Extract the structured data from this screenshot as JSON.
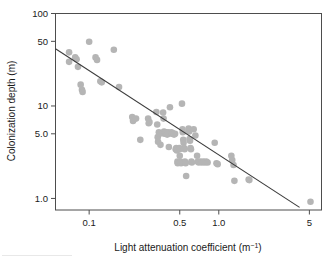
{
  "chart_data": {
    "type": "scatter",
    "title": "",
    "xlabel": "Light attenuation coefficient (m⁻¹)",
    "xlabel_base": "Light attenuation coefficient (m",
    "xlabel_exponent": "−1",
    "xlabel_close": ")",
    "ylabel": "Colonization depth (m)",
    "xscale": "log",
    "yscale": "log",
    "xlim": [
      0.055,
      6.2
    ],
    "ylim": [
      0.75,
      100
    ],
    "xticks": [
      0.1,
      0.5,
      1.0,
      5
    ],
    "xtick_labels": [
      "0.1",
      "0.5",
      "1.0",
      "5"
    ],
    "yticks": [
      1.0,
      5.0,
      10,
      50,
      100
    ],
    "ytick_labels": [
      "1.0",
      "5.0",
      "10",
      "50",
      "100"
    ],
    "grid": false,
    "legend": null,
    "marker_color": "#b5b5b5",
    "marker_size": 4.6,
    "line_color": "#3c3c3c",
    "frame_color": "#4d4d4d",
    "trendline": {
      "type": "linear-in-log-log",
      "x_start": 0.055,
      "y_start": 41.5,
      "x_end": 4.2,
      "y_end": 0.8
    },
    "points": [
      [
        0.07,
        38.0
      ],
      [
        0.07,
        30.0
      ],
      [
        0.078,
        33.5
      ],
      [
        0.08,
        32.0
      ],
      [
        0.082,
        26.5
      ],
      [
        0.086,
        17.0
      ],
      [
        0.088,
        15.0
      ],
      [
        0.089,
        14.2
      ],
      [
        0.1,
        49.5
      ],
      [
        0.112,
        33.5
      ],
      [
        0.115,
        31.5
      ],
      [
        0.122,
        18.5
      ],
      [
        0.125,
        18.0
      ],
      [
        0.155,
        40.5
      ],
      [
        0.17,
        16.0
      ],
      [
        0.215,
        7.6
      ],
      [
        0.218,
        6.9
      ],
      [
        0.23,
        7.3
      ],
      [
        0.248,
        4.3
      ],
      [
        0.285,
        7.3
      ],
      [
        0.288,
        6.5
      ],
      [
        0.292,
        6.7
      ],
      [
        0.33,
        8.6
      ],
      [
        0.335,
        6.3
      ],
      [
        0.338,
        4.6
      ],
      [
        0.34,
        4.1
      ],
      [
        0.345,
        5.2
      ],
      [
        0.35,
        5.0
      ],
      [
        0.355,
        3.8
      ],
      [
        0.372,
        8.5
      ],
      [
        0.375,
        7.3
      ],
      [
        0.378,
        5.3
      ],
      [
        0.38,
        5.0
      ],
      [
        0.385,
        5.2
      ],
      [
        0.39,
        5.1
      ],
      [
        0.395,
        5.0
      ],
      [
        0.4,
        4.9
      ],
      [
        0.405,
        5.2
      ],
      [
        0.408,
        5.0
      ],
      [
        0.412,
        3.6
      ],
      [
        0.42,
        9.7
      ],
      [
        0.43,
        5.2
      ],
      [
        0.435,
        5.0
      ],
      [
        0.44,
        5.1
      ],
      [
        0.445,
        5.0
      ],
      [
        0.452,
        4.9
      ],
      [
        0.46,
        5.0
      ],
      [
        0.465,
        3.4
      ],
      [
        0.47,
        3.5
      ],
      [
        0.475,
        3.3
      ],
      [
        0.48,
        2.5
      ],
      [
        0.482,
        2.4
      ],
      [
        0.495,
        3.5
      ],
      [
        0.498,
        3.4
      ],
      [
        0.5,
        2.9
      ],
      [
        0.505,
        2.5
      ],
      [
        0.508,
        2.45
      ],
      [
        0.512,
        2.4
      ],
      [
        0.52,
        10.6
      ],
      [
        0.525,
        5.6
      ],
      [
        0.528,
        5.2
      ],
      [
        0.532,
        4.3
      ],
      [
        0.535,
        4.0
      ],
      [
        0.54,
        3.5
      ],
      [
        0.545,
        3.4
      ],
      [
        0.548,
        2.5
      ],
      [
        0.552,
        2.45
      ],
      [
        0.555,
        2.4
      ],
      [
        0.56,
        1.75
      ],
      [
        0.585,
        5.7
      ],
      [
        0.59,
        5.3
      ],
      [
        0.595,
        4.4
      ],
      [
        0.6,
        4.2
      ],
      [
        0.605,
        3.5
      ],
      [
        0.61,
        3.4
      ],
      [
        0.615,
        2.5
      ],
      [
        0.62,
        2.45
      ],
      [
        0.64,
        5.6
      ],
      [
        0.66,
        4.8
      ],
      [
        0.68,
        2.9
      ],
      [
        0.69,
        2.5
      ],
      [
        0.7,
        2.45
      ],
      [
        0.72,
        2.5
      ],
      [
        0.74,
        2.45
      ],
      [
        0.76,
        2.5
      ],
      [
        0.78,
        2.45
      ],
      [
        0.8,
        2.5
      ],
      [
        0.82,
        2.45
      ],
      [
        0.93,
        4.0
      ],
      [
        0.96,
        2.4
      ],
      [
        0.98,
        2.35
      ],
      [
        1.25,
        2.9
      ],
      [
        1.27,
        2.6
      ],
      [
        1.3,
        2.3
      ],
      [
        1.32,
        1.55
      ],
      [
        1.7,
        1.6
      ],
      [
        1.72,
        1.58
      ],
      [
        5.1,
        0.92
      ]
    ]
  }
}
